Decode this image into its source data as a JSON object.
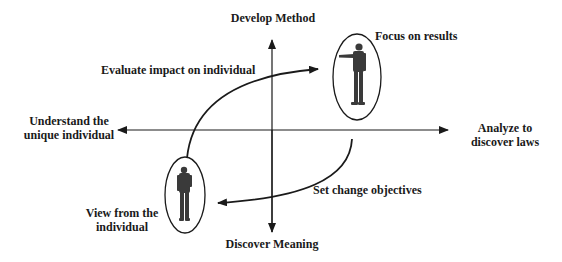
{
  "diagram": {
    "axes": {
      "top": "Develop Method",
      "bottom": "Discover Meaning",
      "left_line1": "Understand the",
      "left_line2": "unique individual",
      "right_line1": "Analyze to",
      "right_line2": "discover laws"
    },
    "arrows": {
      "upper": "Evaluate impact on individual",
      "lower": "Set change objectives"
    },
    "figures": {
      "top_right": "Focus on results",
      "bottom_left_line1": "View from the",
      "bottom_left_line2": "individual"
    },
    "colors": {
      "line": "#1a1a1a",
      "text": "#1a1a1a",
      "figure": "#3a3a3a",
      "background": "#ffffff"
    }
  }
}
